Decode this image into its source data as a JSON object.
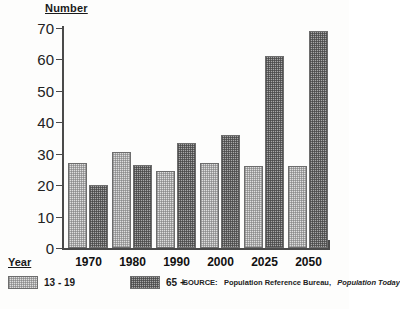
{
  "axis": {
    "y_title": "Number",
    "x_title": "Year"
  },
  "legend": {
    "items": [
      {
        "label": "13 - 19",
        "swatch": "light-stipple-swatch"
      },
      {
        "label": "65 +",
        "swatch": "dark-stipple-swatch"
      }
    ]
  },
  "source": {
    "prefix": "SOURCE:",
    "publisher": "Population Reference Bureau,",
    "publication": "Population Today"
  },
  "chart_data": {
    "type": "bar",
    "title": "",
    "xlabel": "Year",
    "ylabel": "Number",
    "ylim": [
      0,
      70
    ],
    "yticks": [
      0,
      10,
      20,
      30,
      40,
      50,
      60,
      70
    ],
    "grid": false,
    "legend_position": "bottom-left",
    "categories": [
      "1970",
      "1980",
      "1990",
      "2000",
      "2025",
      "2050"
    ],
    "series": [
      {
        "name": "13 - 19",
        "values": [
          27,
          30.5,
          24.5,
          27,
          26,
          26
        ]
      },
      {
        "name": "65 +",
        "values": [
          20,
          26.5,
          33.5,
          36,
          61,
          69
        ]
      }
    ]
  },
  "colors": {
    "axis": "#4a4a4a",
    "bar_light": "#dedede",
    "bar_dark": "#a8a8a8",
    "text": "#1a1a1a",
    "background": "#ffffff"
  }
}
